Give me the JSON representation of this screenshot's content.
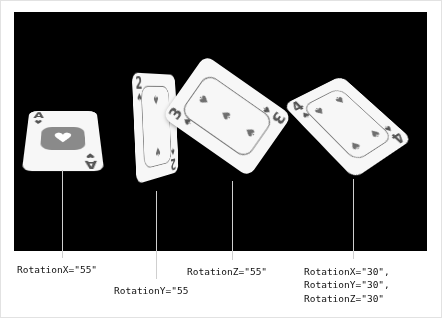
{
  "stage": {
    "background_color": "#000000",
    "page_background": "#ffffff"
  },
  "cards": [
    {
      "id": "ace-hearts",
      "rank": "A",
      "suit_name": "heart",
      "suit_glyph": "♥",
      "rotation_label": "RotationX=\"55\"",
      "rotation": {
        "x": 55,
        "y": 0,
        "z": 0
      }
    },
    {
      "id": "two-spades",
      "rank": "2",
      "suit_name": "spade",
      "suit_glyph": "♠",
      "rotation_label": "RotationY=\"55",
      "rotation": {
        "x": 0,
        "y": 55,
        "z": 0
      }
    },
    {
      "id": "three-spades",
      "rank": "3",
      "suit_name": "spade",
      "suit_glyph": "♠",
      "rotation_label": "RotationZ=\"55\"",
      "rotation": {
        "x": 0,
        "y": 0,
        "z": 55
      }
    },
    {
      "id": "four-spades",
      "rank": "4",
      "suit_name": "spade",
      "suit_glyph": "♠",
      "rotation_label": "RotationX=\"30\",\nRotationY=\"30\",\nRotationZ=\"30\"",
      "rotation": {
        "x": 30,
        "y": 30,
        "z": 30
      }
    }
  ],
  "labels": {
    "label_1": "RotationX=\"55\"",
    "label_2": "RotationY=\"55",
    "label_3": "RotationZ=\"55\"",
    "label_4": "RotationX=\"30\",\nRotationY=\"30\",\nRotationZ=\"30\""
  }
}
